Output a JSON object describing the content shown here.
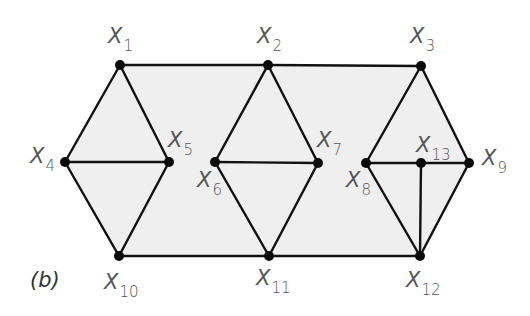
{
  "figure": {
    "panel_label": "(b)",
    "fill_color": "#efefef",
    "edge_color": "#111111",
    "label_color": "#555555"
  },
  "nodes": [
    {
      "id": "X1",
      "base": "X",
      "sub": "1",
      "x": 120,
      "y": 65,
      "lx": 108,
      "ly": 26
    },
    {
      "id": "X2",
      "base": "X",
      "sub": "2",
      "x": 268,
      "y": 65,
      "lx": 257,
      "ly": 26
    },
    {
      "id": "X3",
      "base": "X",
      "sub": "3",
      "x": 421,
      "y": 66,
      "lx": 410,
      "ly": 26
    },
    {
      "id": "X4",
      "base": "X",
      "sub": "4",
      "x": 65,
      "y": 162,
      "lx": 30,
      "ly": 146
    },
    {
      "id": "X5",
      "base": "X",
      "sub": "5",
      "x": 169,
      "y": 162,
      "lx": 168,
      "ly": 130
    },
    {
      "id": "X6",
      "base": "X",
      "sub": "6",
      "x": 215,
      "y": 162,
      "lx": 197,
      "ly": 170
    },
    {
      "id": "X7",
      "base": "X",
      "sub": "7",
      "x": 318,
      "y": 163,
      "lx": 317,
      "ly": 130
    },
    {
      "id": "X8",
      "base": "X",
      "sub": "8",
      "x": 366,
      "y": 163,
      "lx": 346,
      "ly": 170
    },
    {
      "id": "X9",
      "base": "X",
      "sub": "9",
      "x": 469,
      "y": 163,
      "lx": 482,
      "ly": 148
    },
    {
      "id": "X10",
      "base": "X",
      "sub": "10",
      "x": 119,
      "y": 256,
      "lx": 104,
      "ly": 272
    },
    {
      "id": "X11",
      "base": "X",
      "sub": "11",
      "x": 269,
      "y": 256,
      "lx": 256,
      "ly": 268
    },
    {
      "id": "X12",
      "base": "X",
      "sub": "12",
      "x": 420,
      "y": 256,
      "lx": 406,
      "ly": 270
    },
    {
      "id": "X13",
      "base": "X",
      "sub": "13",
      "x": 421,
      "y": 163,
      "lx": 416,
      "ly": 135
    }
  ],
  "edges": [
    [
      "X1",
      "X2"
    ],
    [
      "X2",
      "X3"
    ],
    [
      "X10",
      "X11"
    ],
    [
      "X11",
      "X12"
    ],
    [
      "X1",
      "X4"
    ],
    [
      "X1",
      "X5"
    ],
    [
      "X4",
      "X5"
    ],
    [
      "X4",
      "X10"
    ],
    [
      "X5",
      "X10"
    ],
    [
      "X2",
      "X6"
    ],
    [
      "X2",
      "X7"
    ],
    [
      "X6",
      "X7"
    ],
    [
      "X6",
      "X11"
    ],
    [
      "X7",
      "X11"
    ],
    [
      "X3",
      "X8"
    ],
    [
      "X3",
      "X9"
    ],
    [
      "X8",
      "X13"
    ],
    [
      "X13",
      "X9"
    ],
    [
      "X8",
      "X12"
    ],
    [
      "X9",
      "X12"
    ],
    [
      "X13",
      "X12"
    ]
  ],
  "shaded_region": [
    "X1",
    "X3",
    "X9",
    "X12",
    "X10",
    "X4"
  ]
}
